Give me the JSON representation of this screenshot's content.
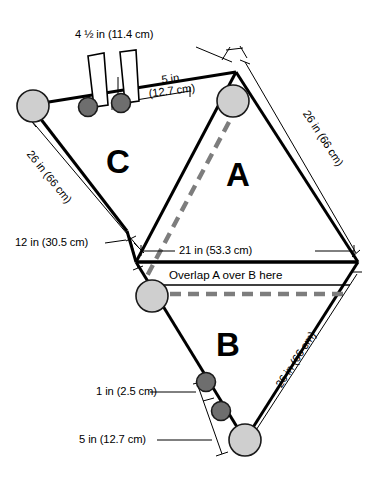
{
  "diagram": {
    "regions": [
      {
        "id": "A",
        "label": "A",
        "x": 232,
        "y": 160
      },
      {
        "id": "B",
        "label": "B",
        "x": 222,
        "y": 330
      },
      {
        "id": "C",
        "label": "C",
        "x": 112,
        "y": 148
      }
    ],
    "dimensions": [
      {
        "id": "top-strap-length",
        "text": "4 ½ in (11.4 cm)",
        "inches": "4 1/2",
        "cm": "11.4",
        "value_html_parts": {
          "whole": "4",
          "num": "1",
          "den": "2",
          "unit": "in",
          "metric": "(11.4 cm)"
        }
      },
      {
        "id": "top-spacing",
        "line1": "5 in",
        "line2": "(12.7 cm)",
        "inches": "5",
        "cm": "12.7"
      },
      {
        "id": "left-upper-edge",
        "text": "26 in (66 cm)",
        "inches": "26",
        "cm": "66"
      },
      {
        "id": "right-upper-edge",
        "text": "26 in (66 cm)",
        "inches": "26",
        "cm": "66"
      },
      {
        "id": "right-lower-edge",
        "text": "26 in (66 cm)",
        "inches": "26",
        "cm": "66"
      },
      {
        "id": "left-short-edge",
        "text": "12 in (30.5 cm)",
        "inches": "12",
        "cm": "30.5"
      },
      {
        "id": "center-width",
        "text": "21 in (53.3 cm)",
        "inches": "21",
        "cm": "53.3"
      },
      {
        "id": "bottom-dot-spacing-small",
        "text": "1 in (2.5 cm)",
        "inches": "1",
        "cm": "2.5"
      },
      {
        "id": "bottom-dot-spacing-large",
        "text": "5 in (12.7 cm)",
        "inches": "5",
        "cm": "12.7"
      }
    ],
    "annotations": [
      {
        "id": "overlap-note",
        "text": "Overlap A over B here"
      }
    ],
    "colors": {
      "outline": "#000000",
      "large_dot_fill": "#cfcfcf",
      "small_dot_fill": "#6e6e6e",
      "dot_stroke": "#1a1a1a",
      "dashed_guide": "#808080",
      "background": "#ffffff"
    },
    "markers": {
      "large_grommets": 4,
      "small_grommets": 4,
      "straps": 2
    }
  }
}
